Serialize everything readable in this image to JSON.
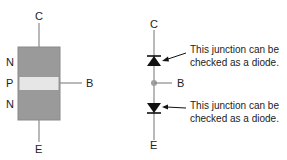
{
  "left_diagram": {
    "terminals": {
      "collector": "C",
      "base": "B",
      "emitter": "E"
    },
    "layers": [
      "N",
      "P",
      "N"
    ],
    "colors": {
      "n_region": "#9a9a9a",
      "p_region": "#e6e6e6",
      "lead": "#8a8a8a"
    }
  },
  "right_diagram": {
    "terminals": {
      "collector": "C",
      "base": "B",
      "emitter": "E"
    },
    "annotations": [
      {
        "line1": "This junction can be",
        "line2": "checked as a diode."
      },
      {
        "line1": "This junction can be",
        "line2": "checked as a diode."
      }
    ],
    "colors": {
      "diode": "#111111",
      "wire": "#8a8a8a",
      "node": "#a0a0a0"
    }
  }
}
